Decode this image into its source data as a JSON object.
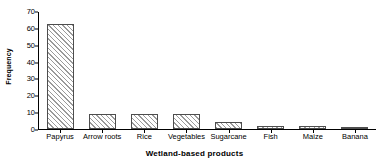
{
  "chart_data": {
    "type": "bar",
    "title": "",
    "xlabel": "Wetland-based products",
    "ylabel": "Frequency",
    "categories": [
      "Papyrus",
      "Arrow roots",
      "Rice",
      "Vegetables",
      "Sugarcane",
      "Fish",
      "Maize",
      "Banana"
    ],
    "values": [
      63,
      9,
      9,
      9,
      4,
      2,
      2,
      1
    ],
    "ylim": [
      0,
      70
    ],
    "yticks": [
      0,
      10,
      20,
      30,
      40,
      50,
      60,
      70
    ],
    "ytick_labels": [
      "0",
      "10",
      "20",
      "30",
      "40",
      "50",
      "60",
      "70"
    ],
    "grid": false,
    "legend": "none",
    "bar_fill": "diagonal-hatch",
    "bar_border_color": "#4d4d4d",
    "hatch_color": "#9a9a9a",
    "axis_color": "#000000"
  }
}
